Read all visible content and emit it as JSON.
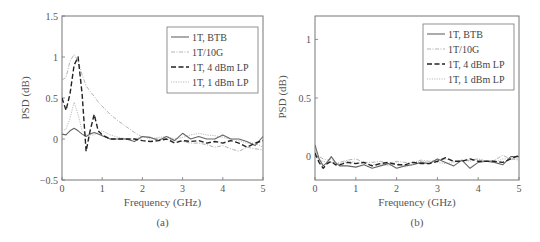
{
  "chart_data": [
    {
      "type": "line",
      "panel_label": "(a)",
      "title": "",
      "xlabel": "Frequency (GHz)",
      "ylabel": "PSD (dB)",
      "xlim": [
        0,
        5
      ],
      "ylim": [
        -0.5,
        1.5
      ],
      "xticks": [
        "0",
        "1",
        "2",
        "3",
        "4",
        "5"
      ],
      "yticks": [
        "−0.5",
        "0",
        "0.5",
        "1",
        "1.5"
      ],
      "grid": false,
      "legend_position": "upper right",
      "legend": [
        "1T, BTB",
        "1T/10G",
        "1T, 4 dBm LP",
        "1T, 1 dBm LP"
      ],
      "x": [
        0,
        0.1,
        0.2,
        0.3,
        0.4,
        0.5,
        0.6,
        0.7,
        0.8,
        0.9,
        1.0,
        1.2,
        1.4,
        1.6,
        1.8,
        2.0,
        2.2,
        2.4,
        2.6,
        2.8,
        3.0,
        3.2,
        3.4,
        3.6,
        3.8,
        4.0,
        4.2,
        4.4,
        4.6,
        4.8,
        5.0
      ],
      "series": [
        {
          "name": "1T, BTB",
          "style": "solid",
          "values": [
            0.06,
            0.05,
            0.1,
            0.13,
            0.1,
            0.06,
            0.03,
            0.06,
            0.08,
            0.06,
            0.04,
            0.0,
            0.0,
            0.0,
            -0.03,
            0.03,
            0.02,
            -0.02,
            0.03,
            -0.02,
            0.07,
            0.0,
            0.03,
            0.0,
            0.0,
            0.05,
            0.0,
            0.0,
            -0.03,
            -0.08,
            0.03
          ]
        },
        {
          "name": "1T/10G",
          "style": "dash-dot",
          "values": [
            0.72,
            0.75,
            0.95,
            1.03,
            0.95,
            0.78,
            0.65,
            0.58,
            0.52,
            0.45,
            0.4,
            0.3,
            0.22,
            0.15,
            0.08,
            0.02,
            0.02,
            0.0,
            0.0,
            -0.02,
            -0.03,
            -0.05,
            -0.05,
            -0.07,
            -0.1,
            -0.08,
            -0.12,
            -0.15,
            -0.1,
            -0.12,
            -0.13
          ]
        },
        {
          "name": "1T, 4 dBm LP",
          "style": "dashed",
          "values": [
            0.5,
            0.35,
            0.55,
            0.9,
            1.0,
            0.55,
            -0.15,
            0.1,
            0.3,
            0.1,
            0.05,
            0.0,
            0.0,
            0.0,
            0.0,
            -0.02,
            -0.03,
            -0.02,
            0.0,
            -0.05,
            -0.02,
            -0.03,
            -0.02,
            -0.05,
            -0.03,
            -0.05,
            -0.02,
            -0.05,
            -0.1,
            -0.05,
            -0.02
          ]
        },
        {
          "name": "1T, 1 dBm LP",
          "style": "dotted",
          "values": [
            0.1,
            0.12,
            0.25,
            0.45,
            0.3,
            0.1,
            0.05,
            0.05,
            0.05,
            0.08,
            0.1,
            0.05,
            0.02,
            0.0,
            0.0,
            0.03,
            0.0,
            0.02,
            0.03,
            0.0,
            0.02,
            0.05,
            0.07,
            0.05,
            0.04,
            0.02,
            0.0,
            -0.02,
            -0.05,
            -0.05,
            -0.1
          ]
        }
      ]
    },
    {
      "type": "line",
      "panel_label": "(b)",
      "title": "",
      "xlabel": "Frequency (GHz)",
      "ylabel": "PSD (dB)",
      "xlim": [
        0,
        5
      ],
      "ylim": [
        -0.2,
        1.2
      ],
      "xticks": [
        "0",
        "1",
        "2",
        "3",
        "4",
        "5"
      ],
      "yticks": [
        "0",
        "0.5",
        "1"
      ],
      "grid": false,
      "legend_position": "upper right",
      "legend": [
        "1T, BTB",
        "1T/10G",
        "1T, 4 dBm LP",
        "1T, 1 dBm LP"
      ],
      "x": [
        0,
        0.1,
        0.2,
        0.3,
        0.4,
        0.5,
        0.6,
        0.8,
        1.0,
        1.2,
        1.4,
        1.6,
        1.8,
        2.0,
        2.2,
        2.4,
        2.6,
        2.8,
        3.0,
        3.2,
        3.4,
        3.6,
        3.8,
        4.0,
        4.2,
        4.4,
        4.6,
        4.8,
        5.0
      ],
      "series": [
        {
          "name": "1T, BTB",
          "style": "solid",
          "values": [
            0.1,
            -0.02,
            -0.08,
            -0.05,
            0.0,
            -0.05,
            -0.08,
            -0.08,
            -0.09,
            -0.07,
            -0.1,
            -0.08,
            -0.06,
            -0.1,
            -0.08,
            -0.07,
            -0.05,
            -0.06,
            -0.02,
            -0.05,
            -0.08,
            -0.03,
            -0.1,
            -0.05,
            -0.04,
            -0.05,
            -0.07,
            0.0,
            0.0
          ]
        },
        {
          "name": "1T/10G",
          "style": "dash-dot",
          "values": [
            0.05,
            0.0,
            -0.02,
            -0.03,
            -0.02,
            -0.06,
            -0.05,
            -0.03,
            -0.02,
            -0.05,
            -0.05,
            -0.04,
            -0.06,
            -0.04,
            -0.05,
            -0.05,
            -0.03,
            -0.04,
            -0.03,
            -0.02,
            -0.04,
            -0.04,
            -0.03,
            -0.02,
            -0.04,
            -0.03,
            0.01,
            -0.02,
            -0.03
          ]
        },
        {
          "name": "1T, 4 dBm LP",
          "style": "dashed",
          "values": [
            0.03,
            -0.05,
            -0.1,
            -0.06,
            -0.04,
            -0.07,
            -0.07,
            -0.05,
            -0.06,
            -0.05,
            -0.08,
            -0.06,
            -0.05,
            -0.07,
            -0.07,
            -0.05,
            -0.06,
            -0.06,
            -0.04,
            -0.01,
            -0.04,
            -0.04,
            -0.02,
            -0.04,
            -0.04,
            -0.04,
            -0.05,
            -0.02,
            0.01
          ]
        },
        {
          "name": "1T, 1 dBm LP",
          "style": "dotted",
          "values": [
            0.02,
            -0.03,
            -0.04,
            -0.05,
            -0.05,
            -0.06,
            -0.06,
            -0.04,
            -0.05,
            -0.06,
            -0.07,
            -0.06,
            -0.08,
            -0.05,
            -0.09,
            -0.06,
            -0.04,
            -0.05,
            -0.05,
            -0.06,
            -0.05,
            -0.03,
            -0.04,
            -0.02,
            -0.04,
            -0.05,
            -0.02,
            -0.02,
            -0.02
          ]
        }
      ]
    }
  ]
}
